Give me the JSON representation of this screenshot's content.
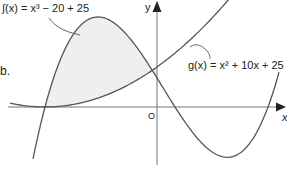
{
  "figure": {
    "part_label": "b.",
    "axes": {
      "x_label": "x",
      "y_label": "y",
      "origin_label": "O"
    },
    "curves": [
      {
        "id": "f",
        "name": "f(x)",
        "label": "∫(x) = x³ − 20 + 25",
        "kind": "cubic"
      },
      {
        "id": "g",
        "name": "g(x)",
        "label": "g(x) = x² + 10x + 25",
        "kind": "parabola"
      }
    ],
    "shaded_region": "area enclosed between f(x) and g(x) left of the y-axis",
    "colors": {
      "curve": "#555555",
      "axis": "#777777",
      "shade": "#efefef",
      "text": "#222222"
    }
  }
}
